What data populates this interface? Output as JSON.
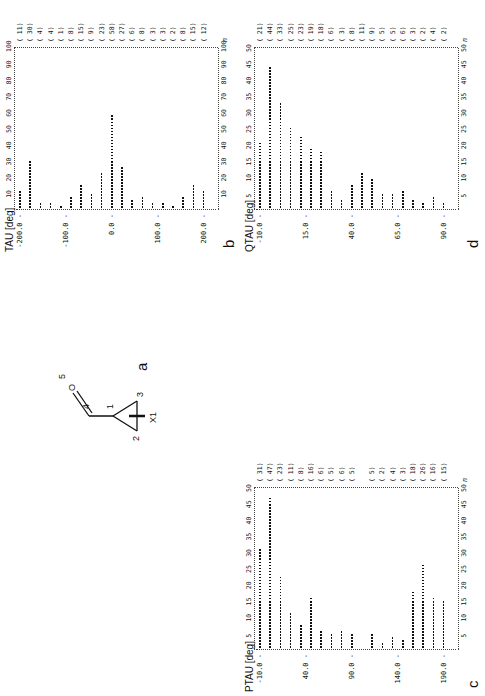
{
  "panels": {
    "a": {
      "label": "a",
      "atoms": {
        "x1": "X1",
        "c1": "1",
        "c2": "2",
        "c3": "3",
        "c4": "4",
        "o5": "5",
        "o": "O"
      }
    },
    "b": {
      "label": "b",
      "title": "TAU [deg]"
    },
    "c": {
      "label": "c",
      "title": "PTAU [deg]"
    },
    "d": {
      "label": "d",
      "title": "QTAU [deg]"
    }
  },
  "chart_data": [
    {
      "id": "b",
      "type": "bar",
      "orientation": "horizontal",
      "title": "TAU [deg]",
      "xlabel": "n",
      "ylabel": "TAU [deg]",
      "category_tick_labels": [
        "-200.0",
        "-100.0",
        "0.0",
        "100.0",
        "200.0"
      ],
      "bin_start": -190,
      "bin_width": 20,
      "counts": [
        11,
        30,
        4,
        4,
        1,
        8,
        15,
        9,
        23,
        58,
        27,
        6,
        8,
        3,
        3,
        2,
        8,
        15,
        12
      ],
      "count_labels": [
        "( 11)",
        "( 30)",
        "( 4)",
        "( 4)",
        "( 1)",
        "( 8)",
        "( 15)",
        "( 9)",
        "( 23)",
        "( 58)",
        "( 27)",
        "( 6)",
        "( 8)",
        "( 3)",
        "( 3)",
        "( 2)",
        "( 8)",
        "( 15)",
        "( 12)"
      ],
      "n_ticks": [
        "10",
        "20",
        "30",
        "40",
        "50",
        "60",
        "70",
        "80",
        "90",
        "100"
      ],
      "xlim": [
        0,
        100
      ]
    },
    {
      "id": "c",
      "type": "bar",
      "orientation": "horizontal",
      "title": "PTAU [deg]",
      "xlabel": "n",
      "ylabel": "PTAU [deg]",
      "category_tick_labels": [
        "-10.0",
        "40.0",
        "90.0",
        "140.0",
        "190.0"
      ],
      "counts": [
        31,
        47,
        23,
        11,
        8,
        16,
        6,
        5,
        6,
        5,
        0,
        5,
        2,
        4,
        3,
        18,
        26,
        16,
        15
      ],
      "count_labels": [
        "( 31)",
        "( 47)",
        "( 23)",
        "( 11)",
        "( 8)",
        "( 16)",
        "( 6)",
        "( 5)",
        "( 6)",
        "( 5)",
        "",
        "( 5)",
        "( 2)",
        "( 4)",
        "( 3)",
        "( 18)",
        "( 26)",
        "( 16)",
        "( 15)"
      ],
      "n_ticks": [
        "5",
        "10",
        "15",
        "20",
        "25",
        "30",
        "35",
        "40",
        "45",
        "50"
      ],
      "xlim": [
        0,
        50
      ]
    },
    {
      "id": "d",
      "type": "bar",
      "orientation": "horizontal",
      "title": "QTAU [deg]",
      "xlabel": "n",
      "ylabel": "QTAU [deg]",
      "category_tick_labels": [
        "-10.0",
        "15.0",
        "40.0",
        "65.0",
        "90.0"
      ],
      "counts": [
        21,
        44,
        33,
        25,
        23,
        19,
        18,
        6,
        3,
        8,
        11,
        9,
        5,
        5,
        6,
        3,
        2,
        4,
        2
      ],
      "count_labels": [
        "( 21)",
        "( 44)",
        "( 33)",
        "( 25)",
        "( 23)",
        "( 19)",
        "( 18)",
        "( 6)",
        "( 3)",
        "( 8)",
        "( 11)",
        "( 9)",
        "( 5)",
        "( 5)",
        "( 6)",
        "( 3)",
        "( 2)",
        "( 4)",
        "( 2)"
      ],
      "n_ticks": [
        "5",
        "10",
        "15",
        "20",
        "25",
        "30",
        "35",
        "40",
        "45",
        "50"
      ],
      "xlim": [
        0,
        50
      ]
    }
  ]
}
